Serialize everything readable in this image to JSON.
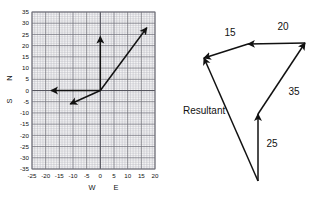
{
  "figure": {
    "title": "",
    "panels": [
      "vector-grid-plot",
      "vector-addition-diagram"
    ]
  },
  "chart_data": {
    "type": "line",
    "title": "",
    "xlabel": "",
    "ylabel": "",
    "xlim": [
      -25,
      20
    ],
    "ylim": [
      -35,
      35
    ],
    "xticks": [
      -25,
      -20,
      -15,
      -10,
      -5,
      0,
      5,
      10,
      15,
      20
    ],
    "yticks": [
      35,
      30,
      25,
      20,
      15,
      10,
      5,
      0,
      -5,
      -10,
      -15,
      -20,
      -25,
      -30,
      -35
    ],
    "xtick_labels": [
      "-25",
      "-20",
      "-15",
      "-10",
      "-5",
      "0",
      "5",
      "10",
      "15",
      "20"
    ],
    "ytick_labels": [
      "35",
      "30",
      "25",
      "20",
      "15",
      "10",
      "5",
      "0",
      "-5",
      "-10",
      "-15",
      "-20",
      "-25",
      "-30",
      "-35"
    ],
    "grid": true,
    "grid_minor": true,
    "direction_labels": {
      "west": "W",
      "east": "E",
      "north": "N",
      "south": "S"
    },
    "series": [
      {
        "name": "vector-north",
        "type": "arrow",
        "x": [
          0,
          0
        ],
        "y": [
          0,
          24
        ]
      },
      {
        "name": "vector-west",
        "type": "arrow",
        "x": [
          0,
          -18
        ],
        "y": [
          0,
          0
        ]
      },
      {
        "name": "vector-southwest-segment",
        "type": "arrow",
        "x": [
          0,
          -11
        ],
        "y": [
          0,
          -6
        ]
      },
      {
        "name": "vector-northeast-resultant",
        "type": "arrow",
        "x": [
          0,
          17
        ],
        "y": [
          0,
          28
        ]
      }
    ]
  },
  "diagram": {
    "name": "vector-addition-polygon",
    "labels": {
      "v25": "25",
      "v35": "35",
      "v20": "20",
      "v15": "15",
      "resultant": "Resultant"
    },
    "vectors": [
      {
        "name": "vector-25",
        "label": "25",
        "from": [
          258,
          181
        ],
        "to": [
          258,
          114
        ]
      },
      {
        "name": "vector-35",
        "label": "35",
        "from": [
          258,
          114
        ],
        "to": [
          305,
          43
        ]
      },
      {
        "name": "vector-20",
        "label": "20",
        "from": [
          305,
          43
        ],
        "to": [
          248,
          44
        ]
      },
      {
        "name": "vector-15",
        "label": "15",
        "from": [
          248,
          44
        ],
        "to": [
          204,
          58
        ]
      },
      {
        "name": "vector-resultant",
        "label": "Resultant",
        "from": [
          258,
          181
        ],
        "to": [
          204,
          58
        ]
      }
    ],
    "label_positions": {
      "v25": [
        272,
        143
      ],
      "v35": [
        292,
        91
      ],
      "v20": [
        282,
        26
      ],
      "v15": [
        228,
        32
      ],
      "resultant": [
        183,
        112
      ]
    }
  },
  "colors": {
    "background": "#ffffff",
    "ink": "#111111",
    "grid_major": "#6f6f78",
    "grid_minor": "#b9b9c0",
    "grid_fill": "#f3f3f4"
  }
}
